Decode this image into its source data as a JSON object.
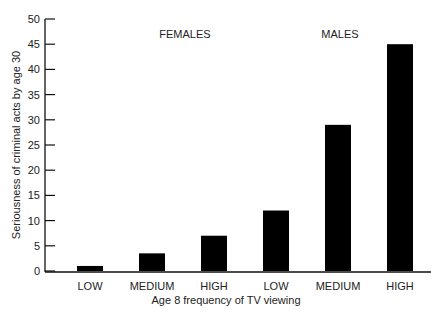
{
  "chart_data": {
    "type": "bar",
    "title": "",
    "xlabel": "Age 8 frequency of TV viewing",
    "ylabel": "Seriousness of criminal acts by age 30",
    "ylim": [
      0,
      50
    ],
    "yticks": [
      0,
      5,
      10,
      15,
      20,
      25,
      30,
      35,
      40,
      45,
      50
    ],
    "grid": false,
    "legend": null,
    "groups": [
      {
        "name": "FEMALES",
        "categories": [
          "LOW",
          "MEDIUM",
          "HIGH"
        ],
        "values": [
          1,
          3.5,
          7
        ]
      },
      {
        "name": "MALES",
        "categories": [
          "LOW",
          "MEDIUM",
          "HIGH"
        ],
        "values": [
          12,
          29,
          45
        ]
      }
    ],
    "categories": [
      "LOW",
      "MEDIUM",
      "HIGH",
      "LOW",
      "MEDIUM",
      "HIGH"
    ],
    "values": [
      1,
      3.5,
      7,
      12,
      29,
      45
    ],
    "bar_color": "#000000"
  }
}
